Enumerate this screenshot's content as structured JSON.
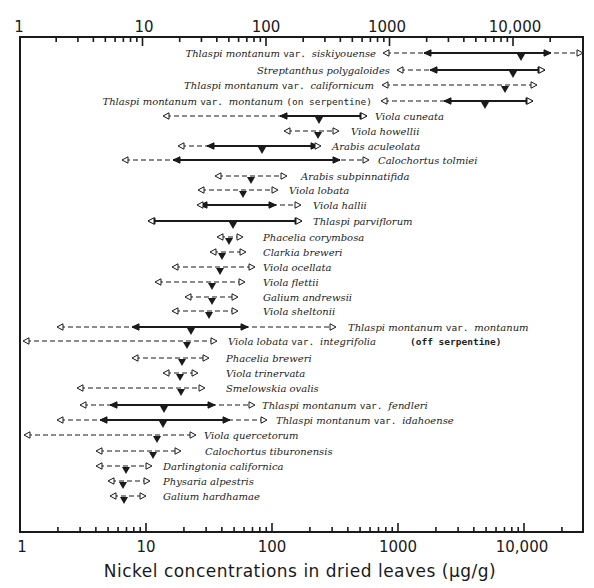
{
  "chart_data": {
    "type": "range",
    "title": "",
    "xlabel": "Nickel concentrations in dried leaves (µg/g)",
    "ylabel": "",
    "xscale": "log",
    "xlim": [
      1,
      30000
    ],
    "grid": false,
    "legend": null,
    "tick_labels": [
      "1",
      "10",
      "100",
      "1000",
      "10,000"
    ],
    "tick_values": [
      1,
      10,
      100,
      1000,
      10000
    ],
    "encoding": {
      "dashed_open_arrows": "full observed range (min–max)",
      "solid_filled_arrows": "typical range",
      "triangle": "mean / typical value"
    },
    "series": [
      {
        "name": "Thlaspi montanum var. siskiyouense",
        "outer": [
          2500,
          28000
        ],
        "inner": [
          5000,
          17000
        ],
        "mean": 10000,
        "label_side": "left"
      },
      {
        "name": "Streptanthus polygaloides",
        "outer": [
          3000,
          15000
        ],
        "inner": [
          5000,
          15000
        ],
        "mean": 8000,
        "label_side": "left"
      },
      {
        "name": "Thlaspi montanum var. californicum",
        "outer": [
          3000,
          14000
        ],
        "inner": null,
        "mean": 7000,
        "label_side": "left"
      },
      {
        "name": "Thlaspi montanum var. montanum (on serpentine)",
        "outer": [
          700,
          13000
        ],
        "inner": [
          2500,
          13000
        ],
        "mean": 5000,
        "label_side": "left"
      },
      {
        "name": "Viola cuneata",
        "outer": [
          13,
          600
        ],
        "inner": [
          110,
          600
        ],
        "mean": 230,
        "label_side": "right"
      },
      {
        "name": "Viola howellii",
        "outer": [
          120,
          350
        ],
        "inner": null,
        "mean": 230,
        "label_side": "right"
      },
      {
        "name": "Arabis aculeolata",
        "outer": [
          16,
          250
        ],
        "inner": [
          30,
          240
        ],
        "mean": 80,
        "label_side": "right"
      },
      {
        "name": "Calochortus tolmiei",
        "outer": [
          5.5,
          700
        ],
        "inner": [
          16,
          350
        ],
        "mean": null,
        "label_side": "right"
      },
      {
        "name": "Arabis subpinnatifida",
        "outer": [
          35,
          150
        ],
        "inner": null,
        "mean": 65,
        "label_side": "right"
      },
      {
        "name": "Viola lobata",
        "outer": [
          26,
          120
        ],
        "inner": null,
        "mean": 50,
        "label_side": "right"
      },
      {
        "name": "Viola hallii",
        "outer": [
          26,
          200
        ],
        "inner": [
          27,
          90
        ],
        "mean": null,
        "label_side": "right"
      },
      {
        "name": "Thlaspi parviflorum",
        "outer": [
          10,
          180
        ],
        "inner": [
          10,
          180
        ],
        "mean": 45,
        "label_side": "right"
      },
      {
        "name": "Phacelia corymbosa",
        "outer": [
          37,
          58
        ],
        "inner": null,
        "mean": 45,
        "label_side": "right"
      },
      {
        "name": "Clarkia breweri",
        "outer": [
          33,
          60
        ],
        "inner": null,
        "mean": 42,
        "label_side": "right"
      },
      {
        "name": "Viola ocellata",
        "outer": [
          17,
          75
        ],
        "inner": null,
        "mean": 38,
        "label_side": "right"
      },
      {
        "name": "Viola flettii",
        "outer": [
          12,
          60
        ],
        "inner": null,
        "mean": 33,
        "label_side": "right"
      },
      {
        "name": "Galium andrewsii",
        "outer": [
          21,
          55
        ],
        "inner": null,
        "mean": 34,
        "label_side": "right"
      },
      {
        "name": "Viola sheltonii",
        "outer": [
          17,
          55
        ],
        "inner": null,
        "mean": 32,
        "label_side": "right"
      },
      {
        "name": "Thlaspi montanum var. montanum (off serpentine)",
        "outer": [
          2,
          350
        ],
        "inner": [
          8,
          65
        ],
        "mean": 22,
        "label_side": "right"
      },
      {
        "name": "Viola lobata var. integrifolia",
        "outer": [
          1.1,
          35
        ],
        "inner": null,
        "mean": 21,
        "label_side": "right"
      },
      {
        "name": "Phacelia breweri",
        "outer": [
          7.5,
          35
        ],
        "inner": null,
        "mean": 19,
        "label_side": "right"
      },
      {
        "name": "Viola trinervata",
        "outer": [
          14,
          26
        ],
        "inner": null,
        "mean": 18,
        "label_side": "right"
      },
      {
        "name": "Smelowskia ovalis",
        "outer": [
          2.8,
          30
        ],
        "inner": null,
        "mean": 18,
        "label_side": "right"
      },
      {
        "name": "Thlaspi montanum var. fendleri",
        "outer": [
          2.8,
          80
        ],
        "inner": [
          4.5,
          40
        ],
        "mean": 13,
        "label_side": "right"
      },
      {
        "name": "Thlaspi montanum var. idahoense",
        "outer": [
          2,
          65
        ],
        "inner": [
          4,
          38
        ],
        "mean": 13,
        "label_side": "right"
      },
      {
        "name": "Viola quercetorum",
        "outer": [
          1.2,
          28
        ],
        "inner": null,
        "mean": 12,
        "label_side": "right"
      },
      {
        "name": "Calochortus tiburonensis",
        "outer": [
          4,
          19
        ],
        "inner": null,
        "mean": 11,
        "label_side": "right"
      },
      {
        "name": "Darlingtonia californica",
        "outer": [
          4,
          12
        ],
        "inner": null,
        "mean": 7,
        "label_side": "right"
      },
      {
        "name": "Physaria alpestris",
        "outer": [
          5,
          12
        ],
        "inner": null,
        "mean": 6.5,
        "label_side": "right"
      },
      {
        "name": "Galium hardhamae",
        "outer": [
          5,
          11
        ],
        "inner": null,
        "mean": 6.5,
        "label_side": "right"
      }
    ]
  },
  "axis": {
    "top_tick_labels": [
      "1",
      "10",
      "100",
      "1000",
      "10,000"
    ],
    "bottom_tick_labels": [
      "1",
      "10",
      "100",
      "1000",
      "10,000"
    ],
    "title": "Nickel concentrations in dried leaves (µg/g)"
  },
  "rows": [
    {
      "label": [
        [
          "Thlaspi montanum ",
          "i"
        ],
        [
          "var. ",
          "r"
        ],
        [
          "siskiyouense",
          "i"
        ]
      ],
      "y": 53,
      "side": "left",
      "lx": 376,
      "o": [
        383,
        583
      ],
      "in": [
        424,
        551
      ],
      "m": 521
    },
    {
      "label": [
        [
          "Streptanthus polygaloides",
          "i"
        ]
      ],
      "y": 70,
      "side": "left",
      "lx": 390,
      "o": [
        397,
        545
      ],
      "in": [
        430,
        545
      ],
      "m": 513
    },
    {
      "label": [
        [
          "Thlaspi montanum ",
          "i"
        ],
        [
          "var. ",
          "r"
        ],
        [
          "californicum",
          "i"
        ]
      ],
      "y": 85,
      "side": "left",
      "lx": 374,
      "o": [
        382,
        537
      ],
      "in": null,
      "m": 505
    },
    {
      "label": [
        [
          "Thlaspi montanum ",
          "i"
        ],
        [
          "var. ",
          "r"
        ],
        [
          "montanum ",
          "i"
        ],
        [
          "(on serpentine)",
          "r"
        ]
      ],
      "y": 101,
      "side": "left",
      "lx": 372,
      "o": [
        381,
        533
      ],
      "in": [
        444,
        533
      ],
      "m": 485
    },
    {
      "label": [
        [
          "Viola cuneata",
          "i"
        ]
      ],
      "y": 116,
      "side": "right",
      "lx": 375,
      "o": [
        163,
        367
      ],
      "in": [
        280,
        367
      ],
      "m": 319
    },
    {
      "label": [
        [
          "Viola howellii",
          "i"
        ]
      ],
      "y": 131,
      "side": "right",
      "lx": 351,
      "o": [
        284,
        339
      ],
      "in": null,
      "m": 318
    },
    {
      "label": [
        [
          "Arabis aculeolata",
          "i"
        ]
      ],
      "y": 146,
      "side": "right",
      "lx": 332,
      "o": [
        178,
        321
      ],
      "in": [
        207,
        318
      ],
      "m": 262
    },
    {
      "label": [
        [
          "Calochortus tolmiei",
          "i"
        ]
      ],
      "y": 160,
      "side": "right",
      "lx": 378,
      "o": [
        122,
        369
      ],
      "in": [
        173,
        340
      ],
      "m": null
    },
    {
      "label": [
        [
          "Arabis subpinnatifida",
          "i"
        ]
      ],
      "y": 176,
      "side": "right",
      "lx": 301,
      "o": [
        215,
        287
      ],
      "in": null,
      "m": 251
    },
    {
      "label": [
        [
          "Viola lobata",
          "i"
        ]
      ],
      "y": 190,
      "side": "right",
      "lx": 289,
      "o": [
        198,
        278
      ],
      "in": null,
      "m": 243
    },
    {
      "label": [
        [
          "Viola hallii",
          "i"
        ]
      ],
      "y": 205,
      "side": "right",
      "lx": 313,
      "o": [
        197,
        301
      ],
      "in": [
        200,
        276
      ],
      "m": null
    },
    {
      "label": [
        [
          "Thlaspi parviflorum",
          "i"
        ]
      ],
      "y": 221,
      "side": "right",
      "lx": 313,
      "o": [
        148,
        302
      ],
      "in": [
        148,
        302
      ],
      "m": 233
    },
    {
      "label": [
        [
          "Phacelia corymbosa",
          "i"
        ]
      ],
      "y": 237,
      "side": "right",
      "lx": 263,
      "o": [
        217,
        243
      ],
      "in": null,
      "m": 229
    },
    {
      "label": [
        [
          "Clarkia breweri",
          "i"
        ]
      ],
      "y": 252,
      "side": "right",
      "lx": 263,
      "o": [
        210,
        246
      ],
      "in": null,
      "m": 222
    },
    {
      "label": [
        [
          "Viola ocellata",
          "i"
        ]
      ],
      "y": 267,
      "side": "right",
      "lx": 263,
      "o": [
        172,
        255
      ],
      "in": null,
      "m": 220
    },
    {
      "label": [
        [
          "Viola flettii",
          "i"
        ]
      ],
      "y": 282,
      "side": "right",
      "lx": 263,
      "o": [
        155,
        245
      ],
      "in": null,
      "m": 212
    },
    {
      "label": [
        [
          "Galium andrewsii",
          "i"
        ]
      ],
      "y": 297,
      "side": "right",
      "lx": 263,
      "o": [
        185,
        238
      ],
      "in": null,
      "m": 212
    },
    {
      "label": [
        [
          "Viola sheltonii",
          "i"
        ]
      ],
      "y": 311,
      "side": "right",
      "lx": 263,
      "o": [
        172,
        238
      ],
      "in": null,
      "m": 209
    },
    {
      "label": [
        [
          "Thlaspi montanum ",
          "i"
        ],
        [
          "var. ",
          "r"
        ],
        [
          "montanum",
          "i"
        ]
      ],
      "y": 327,
      "side": "right",
      "lx": 348,
      "o": [
        57,
        336
      ],
      "in": [
        132,
        248
      ],
      "m": 191
    },
    {
      "label": [
        [
          "Viola lobata ",
          "i"
        ],
        [
          "var. ",
          "r"
        ],
        [
          "integrifolia",
          "i"
        ]
      ],
      "y": 341,
      "side": "right",
      "lx": 228,
      "o": [
        23,
        217
      ],
      "in": null,
      "m": 187
    },
    {
      "label": [
        [
          "Phacelia breweri",
          "i"
        ]
      ],
      "y": 358,
      "side": "right",
      "lx": 226,
      "o": [
        132,
        209
      ],
      "in": null,
      "m": 182
    },
    {
      "label": [
        [
          "Viola trinervata",
          "i"
        ]
      ],
      "y": 373,
      "side": "right",
      "lx": 226,
      "o": [
        163,
        198
      ],
      "in": null,
      "m": 180
    },
    {
      "label": [
        [
          "Smelowskia ovalis",
          "i"
        ]
      ],
      "y": 388,
      "side": "right",
      "lx": 226,
      "o": [
        77,
        205
      ],
      "in": null,
      "m": 181
    },
    {
      "label": [
        [
          "Thlaspi montanum ",
          "i"
        ],
        [
          "var. ",
          "r"
        ],
        [
          "fendleri",
          "i"
        ]
      ],
      "y": 405,
      "side": "right",
      "lx": 262,
      "o": [
        80,
        255
      ],
      "in": [
        110,
        215
      ],
      "m": 164
    },
    {
      "label": [
        [
          "Thlaspi montanum ",
          "i"
        ],
        [
          "var. ",
          "r"
        ],
        [
          "idahoense",
          "i"
        ]
      ],
      "y": 420,
      "side": "right",
      "lx": 276,
      "o": [
        57,
        267
      ],
      "in": [
        100,
        230
      ],
      "m": 163
    },
    {
      "label": [
        [
          "Viola quercetorum",
          "i"
        ]
      ],
      "y": 435,
      "side": "right",
      "lx": 204,
      "o": [
        24,
        196
      ],
      "in": null,
      "m": 157
    },
    {
      "label": [
        [
          "Calochortus tiburonensis",
          "i"
        ]
      ],
      "y": 451,
      "side": "right",
      "lx": 205,
      "o": [
        96,
        181
      ],
      "in": null,
      "m": 153
    },
    {
      "label": [
        [
          "Darlingtonia californica",
          "i"
        ]
      ],
      "y": 466,
      "side": "right",
      "lx": 163,
      "o": [
        96,
        152
      ],
      "in": null,
      "m": 126
    },
    {
      "label": [
        [
          "Physaria alpestris",
          "i"
        ]
      ],
      "y": 481,
      "side": "right",
      "lx": 163,
      "o": [
        108,
        150
      ],
      "in": null,
      "m": 123
    },
    {
      "label": [
        [
          "Galium hardhamae",
          "i"
        ]
      ],
      "y": 496,
      "side": "right",
      "lx": 163,
      "o": [
        110,
        146
      ],
      "in": null,
      "m": 124
    }
  ],
  "annotations": {
    "off_serpentine_note": "(off serpentine)"
  }
}
